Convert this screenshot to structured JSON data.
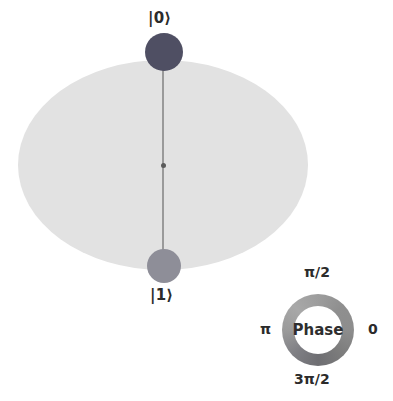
{
  "figure": {
    "type": "qsphere",
    "title": "",
    "background_color": "#ffffff"
  },
  "sphere": {
    "name": "q-sphere-disc",
    "fill_color": "#e2e2e2",
    "meridian_color": "#9a9a9a",
    "center_marker_color": "#5b5b5b"
  },
  "basis_states": [
    {
      "label": "|0⟩",
      "position": "north-pole",
      "node_color": "#4f4f63",
      "node_diameter_px": 38,
      "amplitude_relative": 1.0,
      "phase_radians": 0
    },
    {
      "label": "|1⟩",
      "position": "south-pole",
      "node_color": "#8e8e98",
      "node_diameter_px": 34,
      "amplitude_relative": 0.85,
      "phase_radians": 0
    }
  ],
  "phase_legend": {
    "center_label": "Phase",
    "ticks": {
      "top": "π/2",
      "right": "0",
      "bottom": "3π/2",
      "left": "π"
    },
    "ring_outer_diameter_px": 72,
    "ring_inner_diameter_px": 48
  },
  "chart_data": {
    "type": "scatter",
    "categories": [
      "|0⟩",
      "|1⟩"
    ],
    "values": [
      1.0,
      0.85
    ],
    "series": [
      {
        "name": "amplitude",
        "values": [
          1.0,
          0.85
        ]
      },
      {
        "name": "phase",
        "values": [
          0,
          0
        ]
      }
    ],
    "xlabel": "basis state",
    "ylabel": "amplitude",
    "annotations": [
      "|0⟩",
      "|1⟩",
      "Phase",
      "π/2",
      "0",
      "3π/2",
      "π"
    ],
    "legend_position": "bottom-right",
    "grid": false
  }
}
